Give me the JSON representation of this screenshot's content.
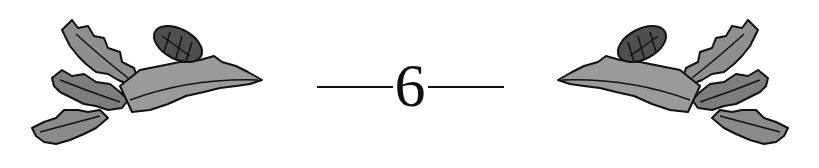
{
  "chapter": {
    "number": "6",
    "ornament_left": "oak-leaf-acorn-icon",
    "ornament_right": "oak-leaf-acorn-icon"
  },
  "colors": {
    "ink": "#111111",
    "leaf_fill": "#8a8a8a",
    "leaf_dark": "#4a4a4a",
    "background": "#ffffff"
  }
}
